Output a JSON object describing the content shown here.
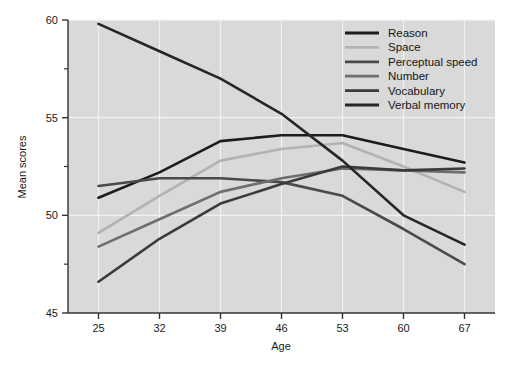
{
  "chart_data": {
    "type": "line",
    "title": "",
    "xlabel": "Age",
    "ylabel": "Mean scores",
    "x": [
      25,
      32,
      39,
      46,
      53,
      60,
      67
    ],
    "categories": [
      "25",
      "32",
      "39",
      "46",
      "53",
      "60",
      "67"
    ],
    "xlim": [
      21.5,
      70.5
    ],
    "ylim": [
      45,
      60
    ],
    "yticks": [
      45,
      50,
      55,
      60
    ],
    "ytick_labels": [
      "45",
      "50",
      "55",
      "60"
    ],
    "yminor_ticks": [
      47.5,
      52.5,
      57.5
    ],
    "grid": "vertical-and-horizontal-white-gridlines",
    "legend_position": "top-right-inside",
    "plot_background": "#d9d9d9",
    "gridline_color": "#f2f2f2",
    "axis_color": "#333333",
    "series": [
      {
        "name": "Reason",
        "color": "#1c1c1c",
        "values": [
          50.9,
          52.2,
          53.8,
          54.1,
          54.1,
          53.4,
          52.7
        ]
      },
      {
        "name": "Space",
        "color": "#b2b2b2",
        "values": [
          49.1,
          51.0,
          52.8,
          53.4,
          53.7,
          52.5,
          51.2
        ]
      },
      {
        "name": "Perceptual speed",
        "color": "#4a4a4a",
        "values": [
          51.5,
          51.9,
          51.9,
          51.7,
          51.0,
          49.3,
          47.5
        ]
      },
      {
        "name": "Number",
        "color": "#6e6e6e",
        "values": [
          48.4,
          49.8,
          51.2,
          51.9,
          52.4,
          52.3,
          52.2
        ]
      },
      {
        "name": "Vocabulary",
        "color": "#3a3a3a",
        "values": [
          46.6,
          48.8,
          50.6,
          51.6,
          52.5,
          52.3,
          52.4
        ]
      },
      {
        "name": "Verbal memory",
        "color": "#262626",
        "values": [
          59.8,
          58.4,
          57.0,
          55.2,
          52.8,
          50.0,
          48.5
        ]
      }
    ]
  },
  "axes": {
    "y_title": "Mean scores",
    "x_title": "Age"
  },
  "legend": {
    "entries": [
      {
        "label": "Reason"
      },
      {
        "label": "Space"
      },
      {
        "label": "Perceptual speed"
      },
      {
        "label": "Number"
      },
      {
        "label": "Vocabulary"
      },
      {
        "label": "Verbal memory"
      }
    ]
  }
}
